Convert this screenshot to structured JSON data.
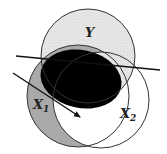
{
  "diagram": {
    "type": "venn",
    "sets": [
      {
        "id": "Y",
        "label": "Y",
        "subscript": ""
      },
      {
        "id": "X1",
        "label": "X",
        "subscript": "1"
      },
      {
        "id": "X2",
        "label": "X",
        "subscript": "2"
      }
    ],
    "regions": {
      "Y_only": {
        "fill": "#e4e4e4",
        "description": "light stippled gray"
      },
      "X1_only": {
        "fill": "#a9a9a9",
        "description": "medium gray"
      },
      "Y_and_X1_core": {
        "fill": "#000000",
        "description": "black filled ellipse"
      },
      "X2_only": {
        "fill": "#ffffff"
      }
    },
    "lines": [
      {
        "id": "line-through",
        "description": "straight line crossing Y and X2",
        "arrow": false
      },
      {
        "id": "arrow",
        "description": "arrow pointing into X1/X2 intersection",
        "arrow": true
      }
    ],
    "colors": {
      "stroke": "#333333",
      "y_fill": "#e4e4e4",
      "x1_fill": "#a9a9a9",
      "core_fill": "#000000"
    }
  }
}
